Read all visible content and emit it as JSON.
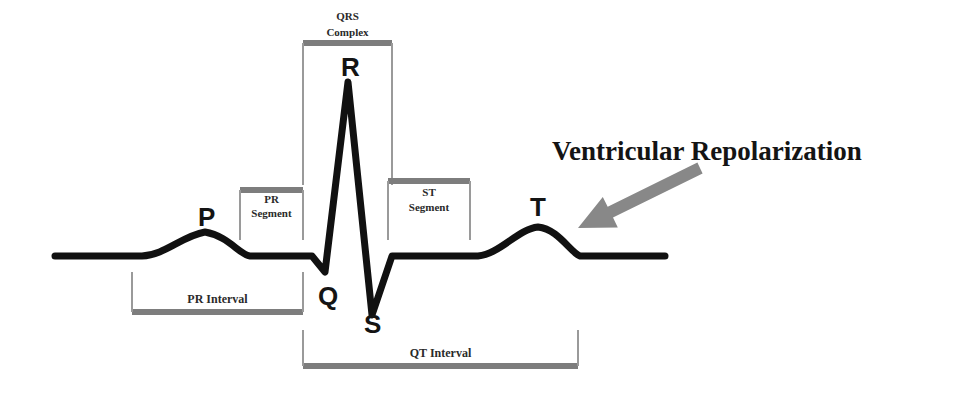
{
  "figure": {
    "background_color": "#ffffff",
    "trace_color": "#111111",
    "bracket_color": "#7d7d7d",
    "arrow_color": "#888888",
    "annotation_color": "#141414"
  },
  "wave_labels": [
    {
      "id": "p",
      "text": "P",
      "x": 198,
      "y": 226
    },
    {
      "id": "q",
      "text": "Q",
      "x": 318,
      "y": 305
    },
    {
      "id": "r",
      "text": "R",
      "x": 341,
      "y": 76
    },
    {
      "id": "s",
      "text": "S",
      "x": 364,
      "y": 333
    },
    {
      "id": "t",
      "text": "T",
      "x": 530,
      "y": 216
    }
  ],
  "brackets": [
    {
      "id": "qrs-complex",
      "label_line1": "QRS",
      "label_line2": "Complex",
      "x_start": 303,
      "x_end": 392,
      "bar_y": 43,
      "tick_end_y": 185,
      "label_y1": 20,
      "label_y2": 36,
      "direction": "down"
    },
    {
      "id": "pr-segment",
      "label_line1": "PR",
      "label_line2": "Segment",
      "x_start": 240,
      "x_end": 303,
      "bar_y": 190,
      "tick_end_y": 240,
      "label_y1": 203,
      "label_y2": 217,
      "direction": "down"
    },
    {
      "id": "st-segment",
      "label_line1": "ST",
      "label_line2": "Segment",
      "x_start": 388,
      "x_end": 470,
      "bar_y": 181,
      "tick_end_y": 240,
      "label_y1": 196,
      "label_y2": 211,
      "direction": "down"
    },
    {
      "id": "pr-interval",
      "label_line1": "PR Interval",
      "label_line2": "",
      "x_start": 132,
      "x_end": 303,
      "bar_y": 312,
      "tick_end_y": 272,
      "label_y1": 303,
      "label_y2": 0,
      "direction": "up"
    },
    {
      "id": "qt-interval",
      "label_line1": "QT Interval",
      "label_line2": "",
      "x_start": 303,
      "x_end": 578,
      "bar_y": 366,
      "tick_end_y": 330,
      "label_y1": 357,
      "label_y2": 0,
      "direction": "up"
    }
  ],
  "annotation": {
    "text": "Ventricular Repolarization",
    "x": 552,
    "y": 160,
    "font_size": 27,
    "arrow": {
      "tail_x": 700,
      "tail_y": 168,
      "tip_x": 578,
      "tip_y": 228
    }
  },
  "chart_data": {
    "type": "line",
    "xlabel": "",
    "ylabel": "",
    "grid": false,
    "legend": "none",
    "baseline_y": 256,
    "x_range": [
      55,
      665
    ],
    "annotations": [
      "P",
      "Q",
      "R",
      "S",
      "T",
      "QRS Complex",
      "PR Segment",
      "ST Segment",
      "PR Interval",
      "QT Interval",
      "Ventricular Repolarization"
    ],
    "features": [
      {
        "name": "baseline-start",
        "x": 55,
        "y": 256
      },
      {
        "name": "p-wave-onset",
        "x": 142,
        "y": 256
      },
      {
        "name": "p-wave-peak",
        "x": 205,
        "y": 232
      },
      {
        "name": "p-wave-offset",
        "x": 248,
        "y": 256
      },
      {
        "name": "pr-segment-flat",
        "x": 303,
        "y": 256
      },
      {
        "name": "q-trough",
        "x": 325,
        "y": 272
      },
      {
        "name": "r-peak",
        "x": 348,
        "y": 82
      },
      {
        "name": "s-trough",
        "x": 372,
        "y": 315
      },
      {
        "name": "st-segment-flat",
        "x": 400,
        "y": 256
      },
      {
        "name": "t-wave-onset",
        "x": 478,
        "y": 256
      },
      {
        "name": "t-wave-peak",
        "x": 538,
        "y": 227
      },
      {
        "name": "t-wave-offset",
        "x": 578,
        "y": 256
      },
      {
        "name": "baseline-end",
        "x": 665,
        "y": 256
      }
    ],
    "trace_path": "M 55,256 L 142,256 C 165,255 182,236 205,232 C 228,236 240,255 250,256 L 312,256 L 325,272 L 348,82 L 372,315 L 392,256 L 478,256 C 500,254 518,229 538,227 C 558,229 570,252 580,256 L 665,256"
  }
}
